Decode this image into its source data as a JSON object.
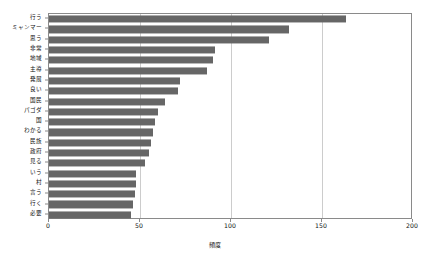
{
  "chart_data": {
    "type": "bar",
    "orientation": "horizontal",
    "title": "",
    "xlabel": "頻度",
    "ylabel": "",
    "xlim": [
      0,
      200
    ],
    "xticks": [
      0,
      50,
      100,
      150,
      200
    ],
    "grid": true,
    "grid_axis": "x",
    "legend": false,
    "bar_color": "#666666",
    "categories": [
      "行う",
      "ミャンマー",
      "思う",
      "非常",
      "地域",
      "主導",
      "発展",
      "良い",
      "国民",
      "パゴダ",
      "国",
      "わかる",
      "民族",
      "政府",
      "見る",
      "いう",
      "村",
      "言う",
      "行く",
      "必要"
    ],
    "values": [
      163,
      132,
      121,
      91,
      90,
      87,
      72,
      71,
      64,
      60,
      58,
      57,
      56,
      55,
      53,
      48,
      48,
      47,
      46,
      45
    ]
  }
}
